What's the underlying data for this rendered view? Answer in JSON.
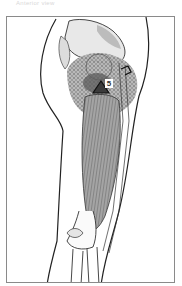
{
  "caption": "Anterior view",
  "figure": {
    "marker": {
      "symbol": "triangle",
      "label": "5"
    },
    "colors": {
      "frame": "#8a8a8a",
      "outline": "#222222",
      "muscle": "#9a9a9a",
      "pain_stipple": "#6d6d6d",
      "marker_fill": "#3b3b3b",
      "pelvis": "#c8c8c8"
    }
  }
}
